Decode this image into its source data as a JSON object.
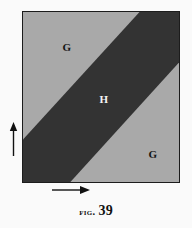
{
  "figure": {
    "caption_prefix": "Fig.",
    "caption_number": "39",
    "caption_full": "FIG. 39"
  },
  "diagram": {
    "type": "geometric-region-diagram",
    "shape": "square",
    "colors": {
      "background": "#fafafa",
      "region_g_fill": "#a9a9a9",
      "region_h_fill": "#333333",
      "border": "#1c1c1c",
      "label_dark": "#141414",
      "label_light": "#f4f4f4"
    },
    "square_bounds": {
      "x": 22,
      "y": 11,
      "width": 158,
      "height": 172
    },
    "regions": [
      {
        "id": "region-g-top",
        "label": "G",
        "fill": "#a9a9a9",
        "label_color": "dark",
        "position": "upper-left triangle"
      },
      {
        "id": "region-h-band",
        "label": "H",
        "fill": "#333333",
        "label_color": "light",
        "position": "central diagonal band"
      },
      {
        "id": "region-g-bottom",
        "label": "G",
        "fill": "#a9a9a9",
        "label_color": "dark",
        "position": "lower-right triangle"
      }
    ],
    "band_geometry": {
      "upper_edge_from": "top border at x=118 (local)",
      "upper_edge_to": "left border at y=129 (local)",
      "lower_edge_from": "right border at y=51 (local)",
      "lower_edge_to": "bottom border at x=48 (local)"
    },
    "axes": [
      {
        "id": "arrow-vertical",
        "direction": "up",
        "position": "left of square"
      },
      {
        "id": "arrow-horizontal",
        "direction": "right",
        "position": "below square"
      }
    ]
  }
}
